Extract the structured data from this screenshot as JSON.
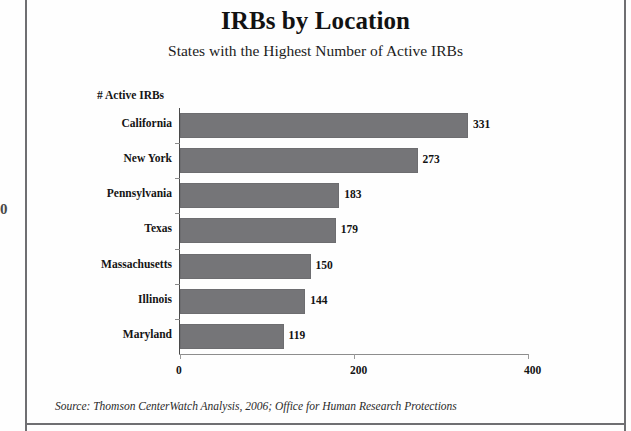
{
  "page": {
    "edge_mark": "0"
  },
  "header": {
    "title": "IRBs by Location",
    "subtitle": "States with the Highest Number of Active IRBs"
  },
  "footer": {
    "source": "Source: Thomson CenterWatch Analysis, 2006; Office for Human Research Protections"
  },
  "chart_data": {
    "type": "bar",
    "orientation": "horizontal",
    "title": "IRBs by Location",
    "subtitle": "States with the Highest Number of Active IRBs",
    "xlabel": "# Active IRBs",
    "ylabel": "",
    "axis_caption": "# Active IRBs",
    "categories": [
      "California",
      "New York",
      "Pennsylvania",
      "Texas",
      "Massachusetts",
      "Illinois",
      "Maryland"
    ],
    "values": [
      331,
      273,
      183,
      179,
      150,
      144,
      119
    ],
    "value_labels": [
      "331",
      "273",
      "183",
      "179",
      "150",
      "144",
      "119"
    ],
    "xlim": [
      0,
      400
    ],
    "xticks": [
      0,
      200,
      400
    ],
    "xtick_labels": [
      "0",
      "200",
      "400"
    ],
    "grid": false,
    "legend": false,
    "bar_color": "#757578",
    "axis_color": "#8d8d8d",
    "text_color": "#141414",
    "background": "#ffffff",
    "source": "Source: Thomson CenterWatch Analysis, 2006; Office for Human Research Protections"
  }
}
